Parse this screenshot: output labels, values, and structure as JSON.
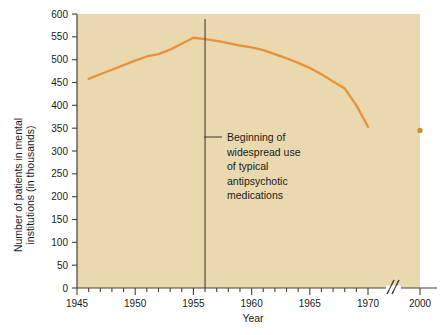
{
  "chart_data": {
    "type": "line",
    "title": "",
    "xlabel": "Year",
    "ylabel_line1": "Number of patients in mental",
    "ylabel_line2": "institutions (in thousands)",
    "ylim": [
      0,
      600
    ],
    "ytick_step": 50,
    "yticks": [
      "0",
      "50",
      "100",
      "150",
      "200",
      "250",
      "300",
      "350",
      "400",
      "450",
      "500",
      "550",
      "600"
    ],
    "xlim": [
      1945,
      1971
    ],
    "xtick_labels": [
      "1945",
      "1950",
      "1955",
      "1960",
      "1965",
      "1970",
      "2000"
    ],
    "xtick_minor_interval": 1,
    "grid": false,
    "legend": "none",
    "axis_break": {
      "present": true,
      "symbol": "//",
      "between": [
        "1970",
        "2000"
      ]
    },
    "series": [
      {
        "name": "Patients in mental institutions",
        "color": "#e8923c",
        "x": [
          1946,
          1947,
          1948,
          1949,
          1950,
          1951,
          1952,
          1953,
          1954,
          1955,
          1956,
          1957,
          1958,
          1959,
          1960,
          1961,
          1962,
          1963,
          1964,
          1965,
          1966,
          1967,
          1968,
          1969,
          1970
        ],
        "values": [
          458,
          468,
          478,
          488,
          498,
          507,
          512,
          522,
          535,
          548,
          545,
          541,
          536,
          531,
          527,
          521,
          512,
          503,
          493,
          482,
          468,
          452,
          437,
          400,
          353
        ]
      }
    ],
    "isolated_points": [
      {
        "name": "Year 2000 value",
        "x": 2000,
        "value": 345,
        "color": "#d88b2e"
      }
    ],
    "annotations": [
      {
        "name": "antipsychotic-introduction",
        "at_x": 1956,
        "vline": true,
        "lines": [
          "Beginning of",
          "widespread use",
          "of typical",
          "antipsychotic",
          "medications"
        ]
      }
    ],
    "colors": {
      "plot_background": "#ead9ae",
      "page_background": "#ffffff",
      "line": "#e8923c",
      "axis": "#4a4038",
      "text": "#1a1a1a",
      "annotation_line": "#4a4038"
    }
  }
}
